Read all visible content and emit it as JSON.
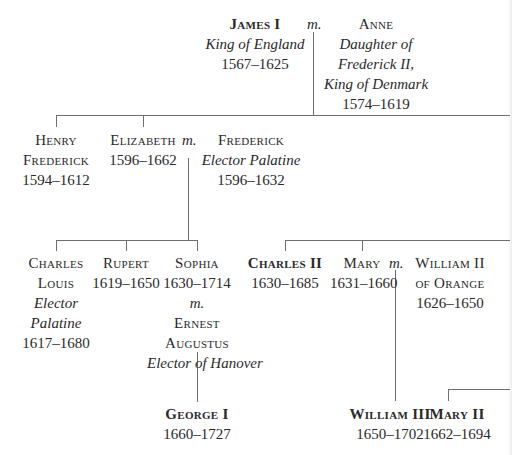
{
  "diagram": {
    "type": "family-tree",
    "marriage_symbol": "m.",
    "line_color": "#6f6f6f",
    "text_color": "#2a2a2a"
  },
  "people": {
    "james_i": {
      "name": "James I",
      "title": "King of England",
      "dates": "1567–1625"
    },
    "anne": {
      "name": "Anne",
      "title_lines": [
        "Daughter of",
        "Frederick II,",
        "King of Denmark"
      ],
      "dates": "1574–1619"
    },
    "henry_frederick": {
      "name_lines": [
        "Henry",
        "Frederick"
      ],
      "dates": "1594–1612"
    },
    "elizabeth": {
      "name": "Elizabeth",
      "dates": "1596–1662"
    },
    "frederick": {
      "name": "Frederick",
      "title": "Elector Palatine",
      "dates": "1596–1632"
    },
    "charles_louis": {
      "name_lines": [
        "Charles",
        "Louis"
      ],
      "title_lines": [
        "Elector",
        "Palatine"
      ],
      "dates": "1617–1680"
    },
    "rupert": {
      "name": "Rupert",
      "dates": "1619–1650"
    },
    "sophia": {
      "name": "Sophia",
      "dates": "1630–1714"
    },
    "ernest_augustus": {
      "name_lines": [
        "Ernest",
        "Augustus"
      ],
      "title": "Elector of Hanover"
    },
    "george_i": {
      "name": "George I",
      "dates": "1660–1727"
    },
    "charles_ii": {
      "name": "Charles II",
      "dates": "1630–1685"
    },
    "mary": {
      "name": "Mary",
      "dates": "1631–1660"
    },
    "william_ii": {
      "name_lines": [
        "William II",
        "of Orange"
      ],
      "dates": "1626–1650"
    },
    "william_iii": {
      "name": "William III",
      "dates": "1650–1702"
    },
    "mary_ii": {
      "name": "Mary II",
      "dates": "1662–1694"
    }
  },
  "marriages": [
    {
      "a": "James I",
      "b": "Anne"
    },
    {
      "a": "Elizabeth",
      "b": "Frederick"
    },
    {
      "a": "Sophia",
      "b": "Ernest Augustus"
    },
    {
      "a": "Mary",
      "b": "William II of Orange"
    }
  ]
}
